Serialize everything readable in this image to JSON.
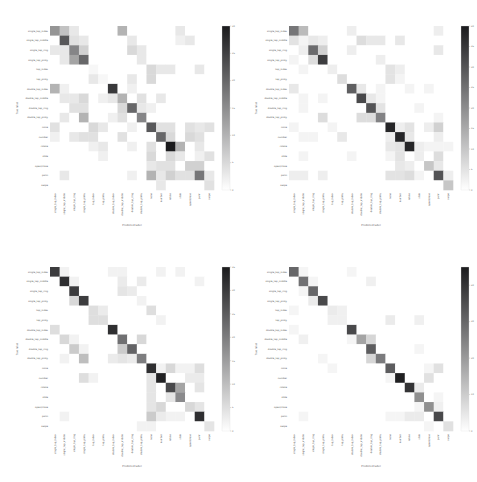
{
  "chart_data": [
    {
      "type": "heatmap",
      "panel": "top-left",
      "title": "",
      "xlabel": "Predicted label",
      "ylabel": "True label",
      "labels": [
        "single_tap_index",
        "single_tap_middle",
        "single_tap_ring",
        "single_tap_pinky",
        "tap_index",
        "tap_pinky",
        "double_tap_index",
        "double_tap_middle",
        "double_tap_ring",
        "double_tap_pinky",
        "none",
        "number",
        "rotate",
        "slide",
        "open/close",
        "palm",
        "swipe"
      ],
      "colorbar": {
        "min": 0,
        "max": 30,
        "ticks": [
          "0",
          "5",
          "10",
          "15",
          "20",
          "25",
          "30"
        ]
      },
      "max": 30,
      "diag": [
        14,
        22,
        16,
        20,
        1,
        1,
        26,
        14,
        20,
        16,
        22,
        20,
        30,
        3,
        1,
        18,
        4
      ],
      "off": [
        [
          0,
          1,
          8
        ],
        [
          0,
          2,
          3
        ],
        [
          0,
          7,
          10
        ],
        [
          0,
          13,
          3
        ],
        [
          1,
          2,
          4
        ],
        [
          1,
          3,
          3
        ],
        [
          1,
          8,
          3
        ],
        [
          1,
          13,
          2
        ],
        [
          1,
          14,
          3
        ],
        [
          2,
          0,
          3
        ],
        [
          2,
          1,
          3
        ],
        [
          2,
          3,
          6
        ],
        [
          2,
          8,
          5
        ],
        [
          2,
          9,
          3
        ],
        [
          3,
          1,
          3
        ],
        [
          3,
          2,
          12
        ],
        [
          3,
          9,
          3
        ],
        [
          4,
          10,
          5
        ],
        [
          4,
          11,
          3
        ],
        [
          4,
          12,
          3
        ],
        [
          4,
          15,
          3
        ],
        [
          5,
          4,
          3
        ],
        [
          5,
          8,
          3
        ],
        [
          5,
          10,
          5
        ],
        [
          6,
          0,
          10
        ],
        [
          6,
          1,
          2
        ],
        [
          6,
          8,
          2
        ],
        [
          7,
          1,
          3
        ],
        [
          7,
          2,
          3
        ],
        [
          7,
          3,
          5
        ],
        [
          7,
          5,
          2
        ],
        [
          7,
          6,
          3
        ],
        [
          7,
          7,
          10
        ],
        [
          7,
          9,
          4
        ],
        [
          7,
          11,
          3
        ],
        [
          8,
          2,
          4
        ],
        [
          8,
          3,
          4
        ],
        [
          8,
          7,
          5
        ],
        [
          8,
          9,
          3
        ],
        [
          8,
          10,
          2
        ],
        [
          9,
          1,
          3
        ],
        [
          9,
          3,
          10
        ],
        [
          9,
          6,
          2
        ],
        [
          9,
          7,
          4
        ],
        [
          10,
          0,
          4
        ],
        [
          10,
          4,
          5
        ],
        [
          10,
          5,
          3
        ],
        [
          10,
          8,
          2
        ],
        [
          10,
          11,
          4
        ],
        [
          10,
          12,
          4
        ],
        [
          10,
          14,
          4
        ],
        [
          10,
          15,
          3
        ],
        [
          10,
          16,
          4
        ],
        [
          11,
          0,
          2
        ],
        [
          11,
          2,
          3
        ],
        [
          11,
          3,
          4
        ],
        [
          11,
          4,
          4
        ],
        [
          11,
          7,
          4
        ],
        [
          11,
          12,
          5
        ],
        [
          11,
          14,
          5
        ],
        [
          11,
          15,
          4
        ],
        [
          12,
          4,
          2
        ],
        [
          12,
          5,
          3
        ],
        [
          12,
          8,
          2
        ],
        [
          12,
          10,
          4
        ],
        [
          12,
          13,
          10
        ],
        [
          12,
          15,
          3
        ],
        [
          13,
          5,
          2
        ],
        [
          13,
          10,
          5
        ],
        [
          13,
          12,
          5
        ],
        [
          13,
          15,
          2
        ],
        [
          13,
          16,
          4
        ],
        [
          14,
          10,
          3
        ],
        [
          14,
          11,
          4
        ],
        [
          14,
          12,
          4
        ],
        [
          14,
          14,
          6
        ],
        [
          14,
          15,
          6
        ],
        [
          15,
          1,
          3
        ],
        [
          15,
          8,
          2
        ],
        [
          15,
          10,
          10
        ],
        [
          15,
          11,
          3
        ],
        [
          15,
          12,
          6
        ],
        [
          15,
          13,
          4
        ],
        [
          15,
          14,
          4
        ],
        [
          15,
          16,
          3
        ],
        [
          16,
          11,
          3
        ]
      ]
    },
    {
      "type": "heatmap",
      "panel": "top-right",
      "title": "",
      "xlabel": "Predicted label",
      "ylabel": "True label",
      "labels": [
        "single_tap_index",
        "single_tap_middle",
        "single_tap_ring",
        "single_tap_pinky",
        "tap_index",
        "tap_pinky",
        "double_tap_index",
        "double_tap_middle",
        "double_tap_ring",
        "double_tap_pinky",
        "none",
        "number",
        "rotate",
        "slide",
        "open/close",
        "palm",
        "swipe"
      ],
      "colorbar": {
        "min": 0,
        "max": 40,
        "ticks": [
          "0",
          "5",
          "10",
          "15",
          "20",
          "25",
          "30",
          "35",
          "40"
        ]
      },
      "max": 40,
      "diag": [
        24,
        2,
        26,
        34,
        3,
        6,
        28,
        32,
        30,
        22,
        38,
        38,
        38,
        3,
        10,
        30,
        10
      ],
      "off": [
        [
          0,
          1,
          12
        ],
        [
          0,
          6,
          3
        ],
        [
          0,
          15,
          3
        ],
        [
          1,
          0,
          5
        ],
        [
          1,
          2,
          4
        ],
        [
          1,
          3,
          3
        ],
        [
          1,
          7,
          6
        ],
        [
          1,
          8,
          4
        ],
        [
          1,
          9,
          4
        ],
        [
          1,
          11,
          4
        ],
        [
          2,
          1,
          3
        ],
        [
          2,
          3,
          8
        ],
        [
          2,
          6,
          3
        ],
        [
          2,
          15,
          4
        ],
        [
          3,
          0,
          2
        ],
        [
          3,
          2,
          6
        ],
        [
          3,
          9,
          3
        ],
        [
          4,
          1,
          2
        ],
        [
          4,
          10,
          5
        ],
        [
          4,
          11,
          3
        ],
        [
          5,
          10,
          5
        ],
        [
          5,
          11,
          2
        ],
        [
          6,
          0,
          4
        ],
        [
          6,
          7,
          4
        ],
        [
          6,
          9,
          2
        ],
        [
          6,
          12,
          2
        ],
        [
          6,
          14,
          2
        ],
        [
          7,
          1,
          2
        ],
        [
          7,
          3,
          2
        ],
        [
          7,
          8,
          4
        ],
        [
          7,
          9,
          2
        ],
        [
          8,
          1,
          2
        ],
        [
          8,
          9,
          5
        ],
        [
          8,
          13,
          2
        ],
        [
          9,
          3,
          6
        ],
        [
          9,
          7,
          6
        ],
        [
          9,
          8,
          6
        ],
        [
          9,
          15,
          2
        ],
        [
          10,
          0,
          2
        ],
        [
          10,
          4,
          2
        ],
        [
          10,
          11,
          3
        ],
        [
          10,
          12,
          5
        ],
        [
          10,
          14,
          3
        ],
        [
          10,
          15,
          8
        ],
        [
          11,
          1,
          2
        ],
        [
          11,
          2,
          2
        ],
        [
          11,
          5,
          4
        ],
        [
          11,
          10,
          3
        ],
        [
          11,
          12,
          4
        ],
        [
          11,
          15,
          3
        ],
        [
          12,
          10,
          4
        ],
        [
          12,
          11,
          5
        ],
        [
          12,
          13,
          3
        ],
        [
          12,
          14,
          2
        ],
        [
          12,
          15,
          2
        ],
        [
          12,
          16,
          2
        ],
        [
          13,
          1,
          2
        ],
        [
          13,
          6,
          2
        ],
        [
          13,
          10,
          2
        ],
        [
          13,
          11,
          5
        ],
        [
          13,
          15,
          6
        ],
        [
          14,
          11,
          4
        ],
        [
          14,
          12,
          3
        ],
        [
          14,
          15,
          4
        ],
        [
          15,
          0,
          3
        ],
        [
          15,
          1,
          3
        ],
        [
          15,
          3,
          3
        ],
        [
          15,
          10,
          5
        ],
        [
          15,
          11,
          5
        ],
        [
          15,
          12,
          6
        ],
        [
          15,
          13,
          2
        ],
        [
          15,
          16,
          3
        ]
      ]
    },
    {
      "type": "heatmap",
      "panel": "bottom-left",
      "title": "",
      "xlabel": "Predicted label",
      "ylabel": "True label",
      "labels": [
        "single_tap_index",
        "single_tap_middle",
        "single_tap_ring",
        "single_tap_pinky",
        "tap_index",
        "tap_pinky",
        "double_tap_index",
        "double_tap_middle",
        "double_tap_ring",
        "double_tap_pinky",
        "none",
        "number",
        "rotate",
        "slide",
        "open/close",
        "palm",
        "swipe"
      ],
      "colorbar": {
        "min": 0,
        "max": 35,
        "ticks": [
          "0",
          "5",
          "10",
          "15",
          "20",
          "25",
          "30",
          "35"
        ]
      },
      "max": 35,
      "diag": [
        30,
        32,
        30,
        30,
        5,
        5,
        32,
        22,
        24,
        20,
        32,
        34,
        28,
        18,
        6,
        32,
        4
      ],
      "off": [
        [
          0,
          1,
          2
        ],
        [
          0,
          6,
          2
        ],
        [
          0,
          7,
          2
        ],
        [
          0,
          11,
          2
        ],
        [
          0,
          13,
          2
        ],
        [
          1,
          2,
          2
        ],
        [
          1,
          7,
          3
        ],
        [
          1,
          9,
          3
        ],
        [
          1,
          15,
          2
        ],
        [
          2,
          7,
          4
        ],
        [
          2,
          8,
          3
        ],
        [
          3,
          2,
          6
        ],
        [
          3,
          9,
          2
        ],
        [
          4,
          5,
          3
        ],
        [
          4,
          10,
          5
        ],
        [
          5,
          4,
          5
        ],
        [
          5,
          11,
          2
        ],
        [
          6,
          0,
          5
        ],
        [
          7,
          1,
          6
        ],
        [
          7,
          2,
          2
        ],
        [
          7,
          9,
          6
        ],
        [
          8,
          2,
          8
        ],
        [
          8,
          3,
          2
        ],
        [
          8,
          7,
          8
        ],
        [
          9,
          1,
          2
        ],
        [
          9,
          3,
          10
        ],
        [
          9,
          6,
          3
        ],
        [
          9,
          7,
          4
        ],
        [
          9,
          8,
          3
        ],
        [
          10,
          11,
          2
        ],
        [
          10,
          12,
          6
        ],
        [
          10,
          13,
          2
        ],
        [
          10,
          14,
          2
        ],
        [
          10,
          15,
          5
        ],
        [
          11,
          3,
          5
        ],
        [
          11,
          4,
          2
        ],
        [
          11,
          10,
          4
        ],
        [
          11,
          14,
          3
        ],
        [
          11,
          15,
          3
        ],
        [
          12,
          10,
          4
        ],
        [
          12,
          13,
          14
        ],
        [
          12,
          15,
          4
        ],
        [
          13,
          10,
          4
        ],
        [
          13,
          12,
          4
        ],
        [
          14,
          10,
          4
        ],
        [
          14,
          11,
          6
        ],
        [
          14,
          15,
          4
        ],
        [
          15,
          1,
          2
        ],
        [
          15,
          10,
          8
        ],
        [
          15,
          11,
          3
        ],
        [
          15,
          12,
          2
        ],
        [
          15,
          13,
          2
        ],
        [
          16,
          9,
          2
        ],
        [
          16,
          10,
          2
        ]
      ]
    },
    {
      "type": "heatmap",
      "panel": "bottom-right",
      "title": "",
      "xlabel": "Predicted label",
      "ylabel": "True label",
      "labels": [
        "single_tap_index",
        "single_tap_middle",
        "single_tap_ring",
        "single_tap_pinky",
        "tap_index",
        "tap_pinky",
        "double_tap_index",
        "double_tap_middle",
        "double_tap_ring",
        "double_tap_pinky",
        "none",
        "number",
        "rotate",
        "slide",
        "open/close",
        "palm",
        "swipe"
      ],
      "colorbar": {
        "min": 0,
        "max": 45,
        "ticks": [
          "0",
          "10",
          "20",
          "30",
          "40"
        ]
      },
      "max": 45,
      "diag": [
        30,
        28,
        30,
        36,
        4,
        3,
        36,
        18,
        32,
        26,
        32,
        44,
        40,
        22,
        22,
        36,
        6
      ],
      "off": [
        [
          0,
          1,
          2
        ],
        [
          0,
          6,
          2
        ],
        [
          1,
          2,
          2
        ],
        [
          1,
          8,
          3
        ],
        [
          2,
          1,
          2
        ],
        [
          3,
          2,
          4
        ],
        [
          4,
          5,
          3
        ],
        [
          4,
          0,
          2
        ],
        [
          5,
          4,
          3
        ],
        [
          5,
          10,
          4
        ],
        [
          5,
          13,
          3
        ],
        [
          6,
          0,
          2
        ],
        [
          7,
          1,
          3
        ],
        [
          7,
          8,
          8
        ],
        [
          7,
          6,
          2
        ],
        [
          8,
          13,
          2
        ],
        [
          9,
          3,
          2
        ],
        [
          9,
          8,
          8
        ],
        [
          10,
          4,
          2
        ],
        [
          10,
          15,
          6
        ],
        [
          10,
          14,
          2
        ],
        [
          11,
          14,
          6
        ],
        [
          11,
          10,
          2
        ],
        [
          12,
          13,
          4
        ],
        [
          13,
          15,
          2
        ],
        [
          14,
          15,
          3
        ],
        [
          14,
          13,
          2
        ],
        [
          15,
          11,
          2
        ],
        [
          15,
          12,
          4
        ],
        [
          15,
          13,
          4
        ],
        [
          15,
          10,
          2
        ],
        [
          15,
          1,
          2
        ],
        [
          16,
          14,
          2
        ]
      ]
    }
  ]
}
